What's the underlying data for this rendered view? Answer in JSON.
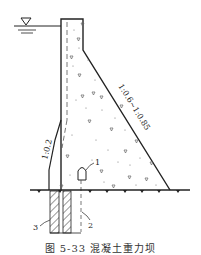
{
  "figure": {
    "caption": "图 5-33 混凝土重力坝",
    "upstream_slope_label": "1:0.2",
    "downstream_slope_label": "1:0.6~1:0.85",
    "callouts": [
      {
        "id": "1",
        "label": "1"
      },
      {
        "id": "2",
        "label": "2"
      },
      {
        "id": "3",
        "label": "3"
      }
    ],
    "water_level_symbol": "▽",
    "colors": {
      "line": "#222222",
      "dash": "#555555",
      "speckle": "#666666",
      "background": "#ffffff"
    }
  }
}
